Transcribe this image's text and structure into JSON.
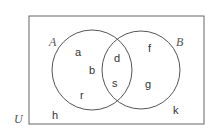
{
  "diagram": {
    "type": "venn",
    "universe": {
      "label": "U",
      "elements": [
        "h",
        "k"
      ]
    },
    "sets": [
      {
        "label": "A",
        "only": [
          "a",
          "b",
          "r"
        ]
      },
      {
        "label": "B",
        "only": [
          "f",
          "g"
        ]
      }
    ],
    "intersection": [
      "d",
      "s"
    ],
    "colors": {
      "stroke": "#555555",
      "text": "#333333",
      "background": "#ffffff"
    },
    "labels": {
      "U": "U",
      "A": "A",
      "B": "B",
      "a": "a",
      "b": "b",
      "r": "r",
      "d": "d",
      "s": "s",
      "f": "f",
      "g": "g",
      "h": "h",
      "k": "k"
    }
  }
}
